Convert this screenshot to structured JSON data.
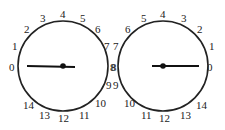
{
  "diagram": {
    "dials": [
      {
        "name": "left-dial",
        "center": [
          63,
          66
        ],
        "radius": 45,
        "hand_direction": "left",
        "labels": [
          {
            "text": "0",
            "x": 9,
            "y": 71
          },
          {
            "text": "1",
            "x": 12,
            "y": 50
          },
          {
            "text": "2",
            "x": 24,
            "y": 33
          },
          {
            "text": "3",
            "x": 40,
            "y": 22
          },
          {
            "text": "4",
            "x": 60,
            "y": 18
          },
          {
            "text": "5",
            "x": 80,
            "y": 22
          },
          {
            "text": "6",
            "x": 95,
            "y": 33
          },
          {
            "text": "7",
            "x": 104,
            "y": 50
          },
          {
            "text": "8",
            "x": 111,
            "y": 71
          },
          {
            "text": "9",
            "x": 106,
            "y": 89
          },
          {
            "text": "10",
            "x": 95,
            "y": 107
          },
          {
            "text": "11",
            "x": 79,
            "y": 119
          },
          {
            "text": "12",
            "x": 58,
            "y": 122
          },
          {
            "text": "13",
            "x": 39,
            "y": 119
          },
          {
            "text": "14",
            "x": 23,
            "y": 109
          }
        ]
      },
      {
        "name": "right-dial",
        "center": [
          163,
          66
        ],
        "radius": 45,
        "hand_direction": "right",
        "labels": [
          {
            "text": "0",
            "x": 207,
            "y": 71
          },
          {
            "text": "1",
            "x": 209,
            "y": 50
          },
          {
            "text": "2",
            "x": 197,
            "y": 33
          },
          {
            "text": "3",
            "x": 181,
            "y": 22
          },
          {
            "text": "4",
            "x": 160,
            "y": 18
          },
          {
            "text": "5",
            "x": 141,
            "y": 22
          },
          {
            "text": "6",
            "x": 125,
            "y": 33
          },
          {
            "text": "7",
            "x": 113,
            "y": 50
          },
          {
            "text": "8",
            "x": 110,
            "y": 71
          },
          {
            "text": "9",
            "x": 113,
            "y": 89
          },
          {
            "text": "10",
            "x": 124,
            "y": 107
          },
          {
            "text": "11",
            "x": 141,
            "y": 119
          },
          {
            "text": "12",
            "x": 159,
            "y": 122
          },
          {
            "text": "13",
            "x": 180,
            "y": 119
          },
          {
            "text": "14",
            "x": 196,
            "y": 109
          }
        ]
      }
    ]
  }
}
